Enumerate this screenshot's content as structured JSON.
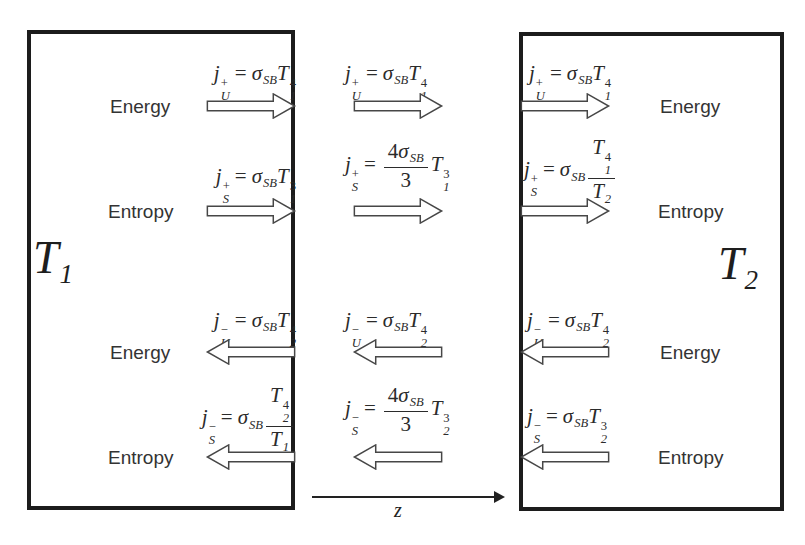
{
  "page": {
    "background": "#ffffff",
    "ink": "#2b2b2b",
    "border_color": "#1c1c1c"
  },
  "plates": {
    "left": {
      "base": "T",
      "sub": "1",
      "text": "T1"
    },
    "right": {
      "base": "T",
      "sub": "2",
      "text": "T2"
    }
  },
  "axis": {
    "label": "z"
  },
  "columns": {
    "left": {
      "rows": [
        {
          "label": "Energy",
          "direction": "right",
          "formula": {
            "text": "j_U^+ = σ_SB T_1^4",
            "tokens": [
              {
                "base": "j",
                "italic": true,
                "sup": "+",
                "sub": "U"
              },
              {
                "op": "="
              },
              {
                "base": "σ",
                "italic": true,
                "sub": "SB"
              },
              {
                "base": "T",
                "italic": true,
                "sup": "4",
                "sub": "1"
              }
            ]
          }
        },
        {
          "label": "Entropy",
          "direction": "right",
          "formula": {
            "text": "j_S^+ = σ_SB T_1^3",
            "tokens": [
              {
                "base": "j",
                "italic": true,
                "sup": "+",
                "sub": "S"
              },
              {
                "op": "="
              },
              {
                "base": "σ",
                "italic": true,
                "sub": "SB"
              },
              {
                "base": "T",
                "italic": true,
                "sup": "3",
                "sub": "1"
              }
            ]
          }
        },
        {
          "label": "Energy",
          "direction": "left",
          "formula": {
            "text": "j_U^− = σ_SB T_2^4",
            "tokens": [
              {
                "base": "j",
                "italic": true,
                "sup": "−",
                "sub": "U"
              },
              {
                "op": "="
              },
              {
                "base": "σ",
                "italic": true,
                "sub": "SB"
              },
              {
                "base": "T",
                "italic": true,
                "sup": "4",
                "sub": "2"
              }
            ]
          }
        },
        {
          "label": "Entropy",
          "direction": "left",
          "formula": {
            "text": "j_S^− = σ_SB T_2^4/T_1",
            "tokens": [
              {
                "base": "j",
                "italic": true,
                "sup": "−",
                "sub": "S"
              },
              {
                "op": "="
              },
              {
                "base": "σ",
                "italic": true,
                "sub": "SB"
              },
              {
                "frac": {
                  "num": [
                    {
                      "base": "T",
                      "italic": true,
                      "sup": "4",
                      "sub": "2"
                    }
                  ],
                  "den": [
                    {
                      "base": "T",
                      "italic": true,
                      "sub": "1"
                    }
                  ]
                }
              }
            ]
          }
        }
      ]
    },
    "middle": {
      "rows": [
        {
          "direction": "right",
          "formula": {
            "text": "j_U^+ = σ_SB T_1^4",
            "tokens": [
              {
                "base": "j",
                "italic": true,
                "sup": "+",
                "sub": "U"
              },
              {
                "op": "="
              },
              {
                "base": "σ",
                "italic": true,
                "sub": "SB"
              },
              {
                "base": "T",
                "italic": true,
                "sup": "4",
                "sub": "1"
              }
            ]
          }
        },
        {
          "direction": "right",
          "formula": {
            "text": "j_S^+ = (4σ_SB/3) T_1^3",
            "tokens": [
              {
                "base": "j",
                "italic": true,
                "sup": "+",
                "sub": "S"
              },
              {
                "op": "="
              },
              {
                "frac": {
                  "num": [
                    {
                      "base": "4"
                    },
                    {
                      "base": "σ",
                      "italic": true,
                      "sub": "SB"
                    }
                  ],
                  "den": [
                    {
                      "base": "3"
                    }
                  ]
                }
              },
              {
                "base": "T",
                "italic": true,
                "sup": "3",
                "sub": "1"
              }
            ]
          }
        },
        {
          "direction": "left",
          "formula": {
            "text": "j_U^− = σ_SB T_2^4",
            "tokens": [
              {
                "base": "j",
                "italic": true,
                "sup": "−",
                "sub": "U"
              },
              {
                "op": "="
              },
              {
                "base": "σ",
                "italic": true,
                "sub": "SB"
              },
              {
                "base": "T",
                "italic": true,
                "sup": "4",
                "sub": "2"
              }
            ]
          }
        },
        {
          "direction": "left",
          "formula": {
            "text": "j_S^− = (4σ_SB/3) T_2^3",
            "tokens": [
              {
                "base": "j",
                "italic": true,
                "sup": "−",
                "sub": "S"
              },
              {
                "op": "="
              },
              {
                "frac": {
                  "num": [
                    {
                      "base": "4"
                    },
                    {
                      "base": "σ",
                      "italic": true,
                      "sub": "SB"
                    }
                  ],
                  "den": [
                    {
                      "base": "3"
                    }
                  ]
                }
              },
              {
                "base": "T",
                "italic": true,
                "sup": "3",
                "sub": "2"
              }
            ]
          }
        }
      ]
    },
    "right": {
      "rows": [
        {
          "label": "Energy",
          "direction": "right",
          "formula": {
            "text": "j_U^+ = σ_SB T_1^4",
            "tokens": [
              {
                "base": "j",
                "italic": true,
                "sup": "+",
                "sub": "U"
              },
              {
                "op": "="
              },
              {
                "base": "σ",
                "italic": true,
                "sub": "SB"
              },
              {
                "base": "T",
                "italic": true,
                "sup": "4",
                "sub": "1"
              }
            ]
          }
        },
        {
          "label": "Entropy",
          "direction": "right",
          "formula": {
            "text": "j_S^+ = σ_SB T_1^4/T_2",
            "tokens": [
              {
                "base": "j",
                "italic": true,
                "sup": "+",
                "sub": "S"
              },
              {
                "op": "="
              },
              {
                "base": "σ",
                "italic": true,
                "sub": "SB"
              },
              {
                "frac": {
                  "num": [
                    {
                      "base": "T",
                      "italic": true,
                      "sup": "4",
                      "sub": "1"
                    }
                  ],
                  "den": [
                    {
                      "base": "T",
                      "italic": true,
                      "sub": "2"
                    }
                  ]
                }
              }
            ]
          }
        },
        {
          "label": "Energy",
          "direction": "left",
          "formula": {
            "text": "j_U^− = σ_SB T_2^4",
            "tokens": [
              {
                "base": "j",
                "italic": true,
                "sup": "−",
                "sub": "U"
              },
              {
                "op": "="
              },
              {
                "base": "σ",
                "italic": true,
                "sub": "SB"
              },
              {
                "base": "T",
                "italic": true,
                "sup": "4",
                "sub": "2"
              }
            ]
          }
        },
        {
          "label": "Entropy",
          "direction": "left",
          "formula": {
            "text": "j_S^− = σ_SB T_2^3",
            "tokens": [
              {
                "base": "j",
                "italic": true,
                "sup": "−",
                "sub": "S"
              },
              {
                "op": "="
              },
              {
                "base": "σ",
                "italic": true,
                "sub": "SB"
              },
              {
                "base": "T",
                "italic": true,
                "sup": "3",
                "sub": "2"
              }
            ]
          }
        }
      ]
    }
  }
}
